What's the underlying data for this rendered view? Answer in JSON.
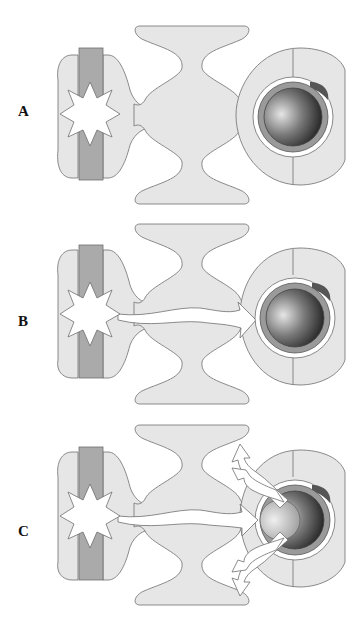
{
  "diagram": {
    "panels": [
      {
        "id": "A",
        "label": "A",
        "top": 0,
        "arrows": "none"
      },
      {
        "id": "B",
        "label": "B",
        "top": 210,
        "arrows": "single"
      },
      {
        "id": "C",
        "label": "C",
        "top": 420,
        "arrows": "spread"
      }
    ],
    "colors": {
      "tissue_fill": "#e6e6e6",
      "outline": "#6e6e6e",
      "bar_fill": "#aaaaaa",
      "ring_fill": "#9a9a9a",
      "sphere_light": "#dddddd",
      "sphere_dark": "#1a1a1a",
      "arrow_fill": "#ffffff",
      "star_fill": "#ffffff"
    }
  }
}
